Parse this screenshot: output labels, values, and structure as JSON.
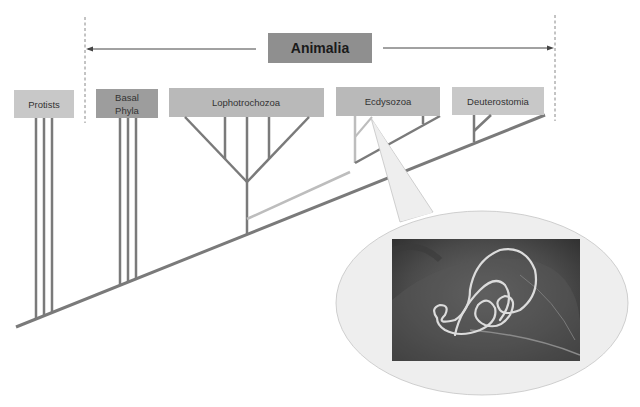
{
  "diagram": {
    "kingdom_label": "Animalia",
    "groups": [
      {
        "id": "protists",
        "label_lines": [
          "Protists"
        ],
        "tone": "light"
      },
      {
        "id": "basal-phyla",
        "label_lines": [
          "Basal",
          "Phyla"
        ],
        "tone": "dark"
      },
      {
        "id": "lophotrochozoa",
        "label_lines": [
          "Lophotrochozoa"
        ],
        "tone": "medium"
      },
      {
        "id": "ecdysozoa",
        "label_lines": [
          "Ecdysozoa"
        ],
        "tone": "medium"
      },
      {
        "id": "deuterostomia",
        "label_lines": [
          "Deuterostomia"
        ],
        "tone": "light"
      }
    ],
    "highlighted_group": "Ecdysozoa",
    "callout_image": "nematode-worm-on-leaf-photo",
    "colors": {
      "box_light": "#c8c8c8",
      "box_medium": "#b9b9b9",
      "box_dark": "#9d9d9d",
      "title_box": "#8f8f8f",
      "branch": "#7a7a7a",
      "highlight_branch": "#bdbdbd",
      "callout_fill": "#eeeeee"
    }
  }
}
